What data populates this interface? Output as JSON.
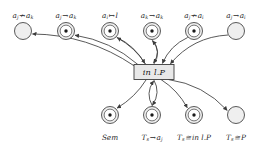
{
  "figure": {
    "type": "petri-net-diagram",
    "colors": {
      "stroke": "#3c3c3c",
      "node_fill": "#efefef",
      "token_fill": "#1a1a1a",
      "transition_fill": "#e8e8e8",
      "label_text": "#2a2a2a",
      "background": "#ffffff"
    },
    "transition": {
      "name": "in-l-P-transition",
      "label": "in l.P",
      "x": 154,
      "y": 72,
      "width": 40,
      "height": 15
    },
    "top_places": [
      {
        "id": "p1",
        "label": "a",
        "label_sub": "j",
        "rel": "↛",
        "label2": "a",
        "label2_sub": "k",
        "x": 23,
        "y": 31,
        "r": 8.5,
        "token": false
      },
      {
        "id": "p2",
        "label": "a",
        "label_sub": "j",
        "rel": "→",
        "label2": "a",
        "label2_sub": "k",
        "x": 66,
        "y": 31,
        "r": 8.5,
        "token": true
      },
      {
        "id": "p3",
        "label": "a",
        "label_sub": "i",
        "rel": "↦",
        "label2": "l",
        "label2_sub": "",
        "x": 110,
        "y": 31,
        "r": 8.5,
        "token": true
      },
      {
        "id": "p4",
        "label": "a",
        "label_sub": "k",
        "rel": "→",
        "label2": "a",
        "label2_sub": "k",
        "x": 152,
        "y": 31,
        "r": 8.5,
        "token": true
      },
      {
        "id": "p5",
        "label": "a",
        "label_sub": "j",
        "rel": "↛",
        "label2": "a",
        "label2_sub": "i",
        "x": 194,
        "y": 31,
        "r": 8.5,
        "token": true
      },
      {
        "id": "p6",
        "label": "a",
        "label_sub": "j",
        "rel": "→",
        "label2": "a",
        "label2_sub": "i",
        "x": 236,
        "y": 31,
        "r": 8.5,
        "token": false
      }
    ],
    "bottom_places": [
      {
        "id": "b1",
        "label": "Sem",
        "label_sub": "",
        "rel": "",
        "label2": "",
        "label2_sub": "",
        "x": 110,
        "y": 115,
        "r": 8.5,
        "token": true
      },
      {
        "id": "b2",
        "label": "T",
        "label_sub": "s",
        "rel": "→",
        "label2": "a",
        "label2_sub": "j",
        "x": 152,
        "y": 115,
        "r": 8.5,
        "token": true
      },
      {
        "id": "b3",
        "label": "T",
        "label_sub": "s",
        "rel": "≅",
        "label2": "in l.P",
        "label2_sub": "",
        "x": 194,
        "y": 115,
        "r": 8.5,
        "token": true
      },
      {
        "id": "b4",
        "label": "T",
        "label_sub": "s",
        "rel": "≅",
        "label2": "P",
        "label2_sub": "",
        "x": 236,
        "y": 115,
        "r": 8.5,
        "token": false
      }
    ],
    "top_label_y": 12,
    "bottom_label_y": 134
  }
}
